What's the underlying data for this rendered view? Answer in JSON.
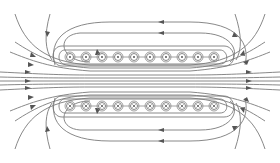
{
  "diagram": {
    "title": "",
    "colors": {
      "line": "#7a7a7a",
      "arrow": "#555555",
      "background": "#ffffff"
    },
    "top_row": {
      "symbol": "dot",
      "meaning": "current out of page",
      "count": 10,
      "y": 57,
      "x": [
        70,
        86,
        102,
        118,
        134,
        150,
        166,
        182,
        198,
        214
      ]
    },
    "bottom_row": {
      "symbol": "cross",
      "meaning": "current into page",
      "count": 10,
      "y": 106,
      "x": [
        70,
        86,
        102,
        118,
        134,
        150,
        166,
        182,
        198,
        214
      ]
    },
    "field_direction_inside": "left-to-right"
  }
}
